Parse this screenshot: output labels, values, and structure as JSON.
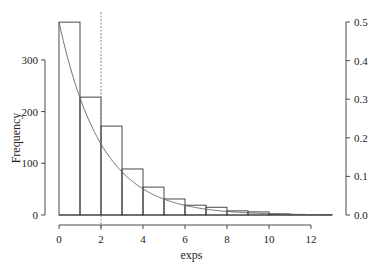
{
  "chart_data": {
    "type": "bar",
    "title": "",
    "xlabel": "exps",
    "ylabel": "Frequency",
    "bin_edges": [
      0,
      1,
      2,
      3,
      4,
      5,
      6,
      7,
      8,
      9,
      10,
      11,
      12,
      13
    ],
    "values": [
      373,
      228,
      172,
      89,
      54,
      31,
      19,
      15,
      8,
      6,
      2,
      1,
      1
    ],
    "xlim": [
      0,
      13
    ],
    "ylim": [
      0,
      373
    ],
    "x_ticks": [
      0,
      2,
      4,
      6,
      8,
      10,
      12
    ],
    "y_ticks_left": [
      0,
      100,
      200,
      300
    ],
    "y_ticks_right": [
      "0.0",
      "0.1",
      "0.2",
      "0.3",
      "0.4",
      "0.5"
    ],
    "secondary_axis": {
      "label": "density",
      "range": [
        0,
        0.5
      ]
    },
    "overlay_curve": {
      "type": "exponential_density",
      "rate": 0.5,
      "formula": "0.5*exp(-0.5*x)"
    },
    "vline": {
      "x": 2,
      "style": "dashed"
    },
    "grid": false,
    "legend": null
  },
  "labels": {
    "xlabel": "exps",
    "ylabel": "Frequency"
  }
}
